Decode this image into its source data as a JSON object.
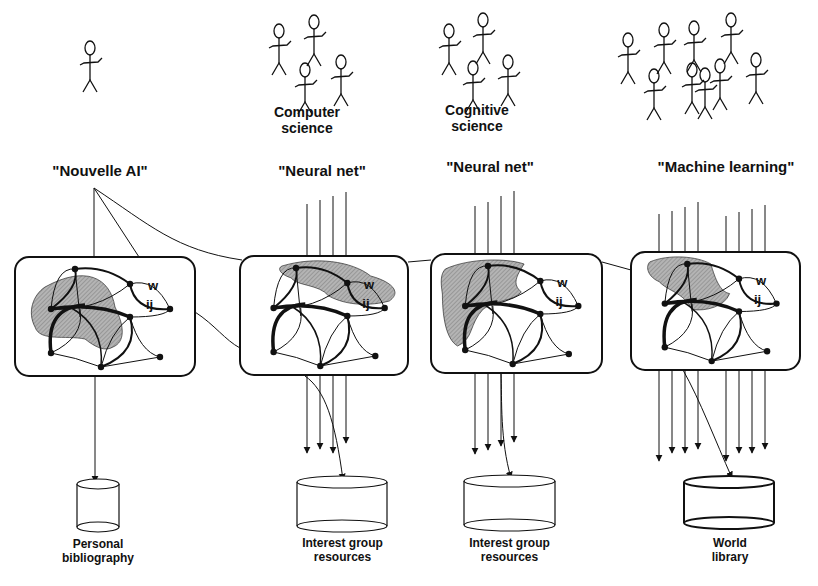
{
  "figure": {
    "columns": [
      {
        "id": "nouvelle-ai",
        "community_label": "",
        "people_count": 1,
        "title": "\"Nouvelle AI\"",
        "network_weight_label": {
          "w": "w",
          "ij": "ij"
        },
        "input_line_count": 0,
        "output_line_count": 1,
        "store": {
          "label_line1": "Personal",
          "label_line2": "bibliography"
        }
      },
      {
        "id": "neural-net-cs",
        "community_label_line1": "Computer",
        "community_label_line2": "science",
        "people_count": 4,
        "title": "\"Neural net\"",
        "network_weight_label": {
          "w": "w",
          "ij": "ij"
        },
        "input_line_count": 4,
        "output_line_count": 4,
        "store": {
          "label_line1": "Interest group",
          "label_line2": "resources"
        }
      },
      {
        "id": "neural-net-cogsci",
        "community_label_line1": "Cognitive",
        "community_label_line2": "science",
        "people_count": 4,
        "title": "\"Neural net\"",
        "network_weight_label": {
          "w": "w",
          "ij": "ij"
        },
        "input_line_count": 4,
        "output_line_count": 4,
        "store": {
          "label_line1": "Interest group",
          "label_line2": "resources"
        }
      },
      {
        "id": "machine-learning",
        "community_label": "",
        "people_count": 9,
        "title": "\"Machine learning\"",
        "network_weight_label": {
          "w": "w",
          "ij": "ij"
        },
        "input_line_count": 8,
        "output_line_count": 8,
        "store": {
          "label_line1": "World",
          "label_line2": "library"
        }
      }
    ],
    "caption_fragment": "",
    "colors": {
      "ink": "#111111",
      "shade": "#a8a8a8",
      "background": "#ffffff"
    }
  }
}
